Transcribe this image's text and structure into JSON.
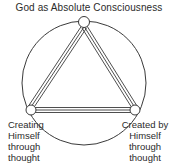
{
  "diagram": {
    "title": "God as Absolute Consciousness",
    "background_color": "#ffffff",
    "stroke_color": "#3a3a3a",
    "text_color": "#2b2b2b",
    "shape": {
      "outer": "circle",
      "inner": "triangle",
      "edge_style": "triple-parallel-line",
      "node_shape": "small-open-circle",
      "node_count": 3
    },
    "nodes": [
      {
        "id": "top",
        "label": "",
        "cx": 84,
        "cy": 22,
        "r": 5.5
      },
      {
        "id": "bottom-left",
        "label": "Creating Himself through thought",
        "cx": 31,
        "cy": 110,
        "r": 5
      },
      {
        "id": "bottom-right",
        "label": "Created by Himself through thought",
        "cx": 135,
        "cy": 110,
        "r": 5
      }
    ],
    "labels": {
      "left": {
        "name": "creating-himself-label",
        "lines": [
          "Creating",
          "Himself",
          "through",
          "thought"
        ]
      },
      "right": {
        "name": "created-by-himself-label",
        "lines": [
          "Created by",
          "Himself",
          "through",
          "thought"
        ]
      }
    },
    "circle": {
      "cx": 84,
      "cy": 83,
      "r": 62
    }
  }
}
